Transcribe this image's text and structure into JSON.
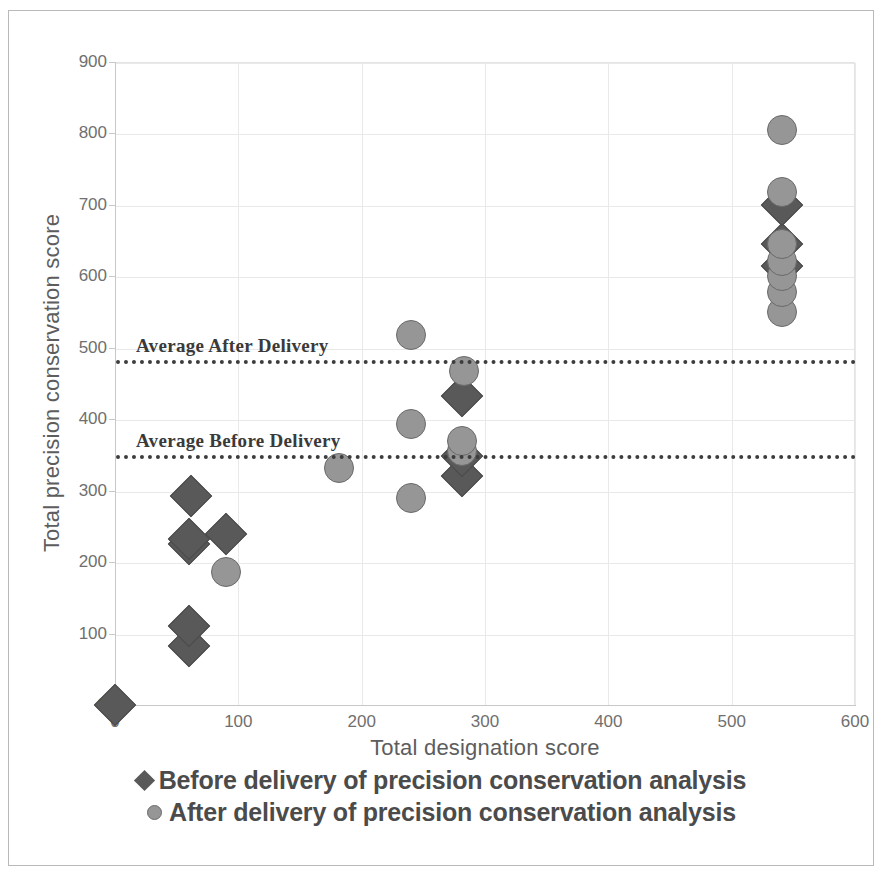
{
  "chart_data": {
    "type": "scatter",
    "title": "",
    "xlabel": "Total designation score",
    "ylabel": "Total precision conservation score",
    "xlim": [
      0,
      600
    ],
    "ylim": [
      0,
      900
    ],
    "xticks": [
      0,
      100,
      200,
      300,
      400,
      500,
      600
    ],
    "yticks": [
      0,
      100,
      200,
      300,
      400,
      500,
      600,
      700,
      800,
      900
    ],
    "grid": true,
    "legend_position": "bottom",
    "colors": {
      "before": "#595959",
      "after": "#969696",
      "gridline": "#e9e9e9",
      "axis": "#c8c8c8",
      "reference_line": "#3d3d3d"
    },
    "series": [
      {
        "name": "Before delivery of precision conservation analysis",
        "marker": "diamond",
        "color": "#595959",
        "points": [
          {
            "x": 0,
            "y": 0
          },
          {
            "x": 60,
            "y": 82
          },
          {
            "x": 60,
            "y": 110
          },
          {
            "x": 60,
            "y": 225
          },
          {
            "x": 60,
            "y": 233
          },
          {
            "x": 62,
            "y": 292
          },
          {
            "x": 90,
            "y": 239
          },
          {
            "x": 281,
            "y": 320
          },
          {
            "x": 281,
            "y": 348
          },
          {
            "x": 281,
            "y": 432
          },
          {
            "x": 541,
            "y": 615
          },
          {
            "x": 541,
            "y": 645
          },
          {
            "x": 541,
            "y": 700
          }
        ]
      },
      {
        "name": "After delivery of precision conservation analysis",
        "marker": "circle",
        "color": "#969696",
        "points": [
          {
            "x": 90,
            "y": 186
          },
          {
            "x": 182,
            "y": 332
          },
          {
            "x": 240,
            "y": 290
          },
          {
            "x": 240,
            "y": 393
          },
          {
            "x": 240,
            "y": 518
          },
          {
            "x": 281,
            "y": 355
          },
          {
            "x": 281,
            "y": 370
          },
          {
            "x": 283,
            "y": 467
          },
          {
            "x": 541,
            "y": 550
          },
          {
            "x": 541,
            "y": 578
          },
          {
            "x": 541,
            "y": 600
          },
          {
            "x": 541,
            "y": 622
          },
          {
            "x": 541,
            "y": 645
          },
          {
            "x": 541,
            "y": 718
          },
          {
            "x": 541,
            "y": 805
          }
        ]
      }
    ],
    "reference_lines": [
      {
        "label": "Average After Delivery",
        "y": 483,
        "style": "dotted"
      },
      {
        "label": "Average Before Delivery",
        "y": 350,
        "style": "dotted"
      }
    ]
  },
  "legend": {
    "items": [
      {
        "label": "Before delivery of precision conservation analysis",
        "marker": "diamond"
      },
      {
        "label": "After delivery of precision conservation analysis",
        "marker": "circle"
      }
    ]
  }
}
